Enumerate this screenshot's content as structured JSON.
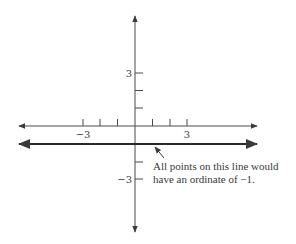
{
  "diagram": {
    "type": "coordinate-plane",
    "x_axis": {
      "ticks": [
        -3,
        -2,
        -1,
        1,
        2,
        3
      ],
      "labels": [
        {
          "value": -3,
          "text": "−3"
        },
        {
          "value": 3,
          "text": "3"
        }
      ]
    },
    "y_axis": {
      "ticks": [
        3,
        2,
        1,
        -2,
        -3
      ],
      "labels": [
        {
          "value": 3,
          "text": "3"
        },
        {
          "value": -3,
          "text": "−3"
        }
      ]
    },
    "highlighted_line": {
      "equation": "y = -1",
      "ordinate": -1
    },
    "annotation": {
      "line1": "All points on this line would",
      "line2": "have an ordinate of −1."
    },
    "colors": {
      "axis": "#3a3a3a",
      "highlighted_line": "#2a2a2a",
      "background": "#ffffff"
    }
  }
}
